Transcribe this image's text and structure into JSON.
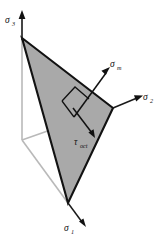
{
  "figure": {
    "background_color": "#ffffff",
    "plane_fill_color": "#a9a9a9",
    "plane_edge_color": "#121212",
    "hidden_axis_color": "#b9b9b9",
    "axis_color": "#1a1a1a"
  },
  "axes": [
    {
      "id": "sigma-3",
      "symbol": "σ",
      "subscript": "3",
      "label": "σ₃",
      "direction": "up",
      "label_position": {
        "x": 6,
        "y": 20
      }
    },
    {
      "id": "sigma-2",
      "symbol": "σ",
      "subscript": "2",
      "label": "σ₂",
      "direction": "right",
      "label_position": {
        "x": 145,
        "y": 100
      }
    },
    {
      "id": "sigma-1",
      "symbol": "σ",
      "subscript": "1",
      "label": "σ₁",
      "direction": "down-right",
      "label_position": {
        "x": 66,
        "y": 228
      }
    }
  ],
  "vectors": [
    {
      "id": "sigma-m",
      "symbol": "σ",
      "subscript": "m",
      "label": "σₘ",
      "description": "mean (normal) stress vector, perpendicular to octahedral plane",
      "label_position": {
        "x": 112,
        "y": 66
      }
    },
    {
      "id": "tau-oct",
      "symbol": "τ",
      "subscript": "oct",
      "label": "τₒₑₜ",
      "description": "octahedral shear stress vector, lies in the octahedral plane",
      "label_position": {
        "x": 79,
        "y": 144
      }
    }
  ],
  "markers": [
    {
      "id": "right-angle",
      "type": "right-angle-square",
      "description": "right angle between sigma_m and tau_oct"
    }
  ],
  "plane": {
    "id": "octahedral-plane",
    "type": "triangle",
    "vertices": [
      {
        "name": "sigma-3-intercept",
        "x": 22,
        "y": 38
      },
      {
        "name": "sigma-2-intercept",
        "x": 113,
        "y": 108
      },
      {
        "name": "sigma-1-intercept",
        "x": 68,
        "y": 203
      }
    ]
  }
}
